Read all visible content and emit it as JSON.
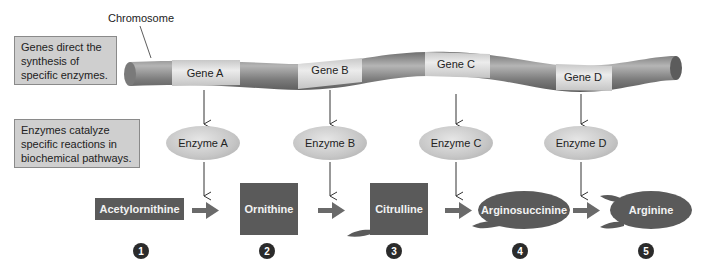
{
  "chromosome": {
    "label": "Chromosome",
    "genes": [
      {
        "label": "Gene A",
        "x": 205,
        "y": 74
      },
      {
        "label": "Gene B",
        "x": 330,
        "y": 68
      },
      {
        "label": "Gene C",
        "x": 456,
        "y": 64
      },
      {
        "label": "Gene D",
        "x": 584,
        "y": 75
      }
    ]
  },
  "notes": {
    "genes_note": "Genes direct the synthesis of specific enzymes.",
    "enzymes_note": "Enzymes catalyze specific reactions in biochemical pathways."
  },
  "enzymes": [
    {
      "label": "Enzyme A",
      "x": 203,
      "y": 143
    },
    {
      "label": "Enzyme B",
      "x": 330,
      "y": 143
    },
    {
      "label": "Enzyme C",
      "x": 456,
      "y": 143
    },
    {
      "label": "Enzyme D",
      "x": 581,
      "y": 143
    }
  ],
  "molecules": [
    {
      "label": "Acetylornithine",
      "step": "1"
    },
    {
      "label": "Ornithine",
      "step": "2"
    },
    {
      "label": "Citrulline",
      "step": "3"
    },
    {
      "label": "Arginosuccinine",
      "step": "4"
    },
    {
      "label": "Arginine",
      "step": "5"
    }
  ],
  "colors": {
    "molecule_fill": "#5a5a5a",
    "arrow": "#6a6a6a",
    "note_fill": "#cfcfcf",
    "step_badge": "#2b2b2b"
  }
}
